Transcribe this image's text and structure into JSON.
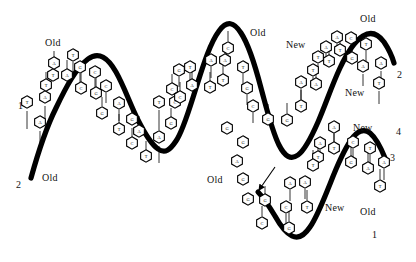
{
  "figure": {
    "background_color": "#ffffff",
    "ink_color": "#000000",
    "width": 416,
    "height": 262
  },
  "strand_labels": [
    {
      "id": "old-top-left",
      "text": "Old",
      "x": 45,
      "y": 38
    },
    {
      "id": "old-bottom-left",
      "text": "Old",
      "x": 42,
      "y": 173
    },
    {
      "id": "old-top-middle",
      "text": "Old",
      "x": 250,
      "y": 28
    },
    {
      "id": "new-top-middle",
      "text": "New",
      "x": 286,
      "y": 40
    },
    {
      "id": "old-top-right",
      "text": "Old",
      "x": 360,
      "y": 14
    },
    {
      "id": "new-right-upper",
      "text": "New",
      "x": 345,
      "y": 88
    },
    {
      "id": "old-center-low",
      "text": "Old",
      "x": 207,
      "y": 175
    },
    {
      "id": "new-lower-right",
      "text": "New",
      "x": 353,
      "y": 123
    },
    {
      "id": "new-lower-mid",
      "text": "New",
      "x": 325,
      "y": 203
    },
    {
      "id": "old-lower-right",
      "text": "Old",
      "x": 360,
      "y": 207
    }
  ],
  "strand_numbers": [
    {
      "id": "num-1-left",
      "text": "1",
      "x": 18,
      "y": 101
    },
    {
      "id": "num-2-left",
      "text": "2",
      "x": 16,
      "y": 180
    },
    {
      "id": "num-2-right",
      "text": "2",
      "x": 397,
      "y": 70
    },
    {
      "id": "num-4-right",
      "text": "4",
      "x": 396,
      "y": 127
    },
    {
      "id": "num-3-right",
      "text": "3",
      "x": 390,
      "y": 153
    },
    {
      "id": "num-1-right",
      "text": "1",
      "x": 372,
      "y": 230
    }
  ],
  "pointer_arrow": {
    "id": "free-nucleotide-arrow",
    "from_x": 275,
    "from_y": 167,
    "to_x": 259,
    "to_y": 190
  },
  "backbones": [
    {
      "id": "parent-strand-upper-left",
      "path": "M 31 178 C 36 160 44 132 56 108 C 66 87 76 68 88 59 C 99 51 108 58 116 72 C 124 86 130 104 138 120 C 145 134 151 144 158 149 C 165 154 170 150 176 141 C 183 131 189 110 196 88 C 203 66 210 43 219 31 C 227 20 234 22 241 33 C 249 45 255 65 261 88 C 267 110 272 131 279 145 C 285 157 291 160 298 155 C 305 150 311 138 318 122 C 325 106 332 85 340 68 C 347 53 355 41 363 36 C 371 31 378 34 384 42 C 388 48 392 56 394 63"
    },
    {
      "id": "daughter-strand-lower-right",
      "path": "M 258 192 C 263 197 269 206 275 216 C 280 225 286 233 292 236 C 298 239 304 236 310 227 C 317 217 323 201 330 184 C 337 166 344 150 351 140 C 357 131 364 128 370 133 C 376 138 381 148 385 158"
    }
  ],
  "base_pairs_legend": {
    "A": "adenine",
    "T": "thymine",
    "G": "guanine",
    "C": "cytosine"
  },
  "bases": [
    {
      "id": "b001",
      "letter": "T",
      "x": 27,
      "y": 102,
      "stem": [
        27,
        111,
        27,
        129
      ]
    },
    {
      "id": "b002",
      "letter": "A",
      "x": 40,
      "y": 122,
      "stem": [
        40,
        131,
        40,
        150
      ]
    },
    {
      "id": "b003",
      "letter": "A",
      "x": 45,
      "y": 97,
      "stem": [
        45,
        106,
        45,
        121
      ]
    },
    {
      "id": "b004",
      "letter": "T",
      "x": 46,
      "y": 85,
      "stem": [
        46,
        80,
        46,
        72
      ]
    },
    {
      "id": "b005",
      "letter": "T",
      "x": 53,
      "y": 75,
      "stem": [
        53,
        70,
        53,
        62
      ]
    },
    {
      "id": "b006",
      "letter": "A",
      "x": 54,
      "y": 63,
      "stem": [
        54,
        58,
        54,
        51
      ]
    },
    {
      "id": "b007",
      "letter": "A",
      "x": 67,
      "y": 75,
      "stem": [
        67,
        69,
        67,
        60
      ]
    },
    {
      "id": "b008",
      "letter": "T",
      "x": 73,
      "y": 55,
      "stem": [
        73,
        62,
        73,
        72
      ]
    },
    {
      "id": "b009",
      "letter": "G",
      "x": 80,
      "y": 67,
      "stem": [
        80,
        74,
        80,
        84
      ]
    },
    {
      "id": "b010",
      "letter": "C",
      "x": 81,
      "y": 88,
      "stem": [
        81,
        82,
        81,
        73
      ]
    },
    {
      "id": "b011",
      "letter": "C",
      "x": 95,
      "y": 72,
      "stem": [
        95,
        79,
        95,
        89
      ]
    },
    {
      "id": "b012",
      "letter": "G",
      "x": 96,
      "y": 93,
      "stem": [
        96,
        87,
        96,
        78
      ]
    },
    {
      "id": "b013",
      "letter": "C",
      "x": 106,
      "y": 86,
      "stem": [
        106,
        93,
        106,
        103
      ]
    },
    {
      "id": "b014",
      "letter": "G",
      "x": 102,
      "y": 113,
      "stem": [
        102,
        106,
        102,
        97
      ]
    },
    {
      "id": "b015",
      "letter": "A",
      "x": 119,
      "y": 103,
      "stem": [
        119,
        110,
        119,
        121
      ]
    },
    {
      "id": "b016",
      "letter": "G",
      "x": 132,
      "y": 119,
      "stem": [
        132,
        113,
        132,
        104
      ]
    },
    {
      "id": "b017",
      "letter": "T",
      "x": 119,
      "y": 129,
      "stem": [
        119,
        123,
        119,
        114
      ]
    },
    {
      "id": "b018",
      "letter": "A",
      "x": 139,
      "y": 131,
      "stem": [
        139,
        125,
        139,
        116
      ]
    },
    {
      "id": "b019",
      "letter": "C",
      "x": 132,
      "y": 143,
      "stem": [
        132,
        137,
        132,
        128
      ]
    },
    {
      "id": "b020",
      "letter": "T",
      "x": 146,
      "y": 156,
      "stem": [
        146,
        150,
        146,
        141
      ]
    },
    {
      "id": "b021",
      "letter": "T",
      "x": 159,
      "y": 102,
      "stem": [
        159,
        110,
        159,
        130
      ]
    },
    {
      "id": "b022",
      "letter": "A",
      "x": 159,
      "y": 137,
      "stem": [
        159,
        146,
        159,
        163
      ]
    },
    {
      "id": "b023",
      "letter": "G",
      "x": 171,
      "y": 123,
      "stem": [
        171,
        117,
        171,
        108
      ]
    },
    {
      "id": "b024",
      "letter": "C",
      "x": 175,
      "y": 102,
      "stem": [
        175,
        96,
        175,
        88
      ]
    },
    {
      "id": "b025",
      "letter": "C",
      "x": 172,
      "y": 89,
      "stem": [
        172,
        83,
        172,
        74
      ]
    },
    {
      "id": "b026",
      "letter": "G",
      "x": 179,
      "y": 70,
      "stem": [
        179,
        77,
        179,
        87
      ]
    },
    {
      "id": "b027",
      "letter": "T",
      "x": 190,
      "y": 67,
      "stem": [
        190,
        74,
        190,
        84
      ]
    },
    {
      "id": "b028",
      "letter": "A",
      "x": 192,
      "y": 85,
      "stem": [
        192,
        79,
        192,
        70
      ]
    },
    {
      "id": "b029",
      "letter": "C",
      "x": 180,
      "y": 97,
      "stem": [
        180,
        91,
        180,
        82
      ]
    },
    {
      "id": "b030",
      "letter": "A",
      "x": 211,
      "y": 60,
      "stem": [
        211,
        67,
        211,
        78
      ]
    },
    {
      "id": "b031",
      "letter": "A",
      "x": 225,
      "y": 60,
      "stem": [
        225,
        54,
        225,
        45
      ]
    },
    {
      "id": "b032",
      "letter": "T",
      "x": 210,
      "y": 87,
      "stem": [
        210,
        81,
        210,
        72
      ]
    },
    {
      "id": "b033",
      "letter": "T",
      "x": 223,
      "y": 80,
      "stem": [
        223,
        74,
        223,
        64
      ]
    },
    {
      "id": "b034",
      "letter": "C",
      "x": 228,
      "y": 48,
      "stem": [
        228,
        41,
        228,
        31
      ]
    },
    {
      "id": "b035",
      "letter": "T",
      "x": 243,
      "y": 67,
      "stem": [
        243,
        74,
        243,
        86
      ]
    },
    {
      "id": "b036",
      "letter": "G",
      "x": 247,
      "y": 88,
      "stem": [
        247,
        95,
        247,
        105
      ]
    },
    {
      "id": "b037",
      "letter": "C",
      "x": 253,
      "y": 106,
      "stem": [
        253,
        113,
        253,
        123
      ]
    },
    {
      "id": "b038",
      "letter": "G",
      "x": 268,
      "y": 119,
      "stem": [
        268,
        113,
        268,
        104
      ]
    },
    {
      "id": "b039",
      "letter": "G",
      "x": 287,
      "y": 120,
      "stem": [
        287,
        113,
        287,
        103
      ]
    },
    {
      "id": "b040",
      "letter": "A",
      "x": 301,
      "y": 82,
      "stem": [
        301,
        89,
        301,
        99
      ]
    },
    {
      "id": "b041",
      "letter": "T",
      "x": 301,
      "y": 106,
      "stem": [
        301,
        100,
        301,
        90
      ]
    },
    {
      "id": "b042",
      "letter": "T",
      "x": 313,
      "y": 70,
      "stem": [
        313,
        77,
        313,
        87
      ]
    },
    {
      "id": "b043",
      "letter": "A",
      "x": 316,
      "y": 84,
      "stem": [
        316,
        78,
        316,
        68
      ]
    },
    {
      "id": "b044",
      "letter": "T",
      "x": 318,
      "y": 57,
      "stem": [
        318,
        64,
        318,
        74
      ]
    },
    {
      "id": "b045",
      "letter": "A",
      "x": 326,
      "y": 47,
      "stem": [
        326,
        54,
        326,
        64
      ]
    },
    {
      "id": "b046",
      "letter": "T",
      "x": 329,
      "y": 61,
      "stem": [
        329,
        55,
        329,
        46
      ]
    },
    {
      "id": "b047",
      "letter": "A",
      "x": 337,
      "y": 37,
      "stem": [
        337,
        44,
        337,
        54
      ]
    },
    {
      "id": "b048",
      "letter": "T",
      "x": 340,
      "y": 50,
      "stem": [
        340,
        44,
        340,
        35
      ]
    },
    {
      "id": "b049",
      "letter": "C",
      "x": 351,
      "y": 38,
      "stem": [
        351,
        45,
        351,
        55
      ]
    },
    {
      "id": "b050",
      "letter": "G",
      "x": 352,
      "y": 58,
      "stem": [
        352,
        52,
        352,
        42
      ]
    },
    {
      "id": "b051",
      "letter": "T",
      "x": 366,
      "y": 44,
      "stem": [
        366,
        51,
        366,
        61
      ]
    },
    {
      "id": "b052",
      "letter": "A",
      "x": 363,
      "y": 66,
      "stem": [
        363,
        74,
        363,
        86
      ]
    },
    {
      "id": "b053",
      "letter": "A",
      "x": 381,
      "y": 63,
      "stem": [
        381,
        71,
        381,
        81
      ]
    },
    {
      "id": "b054",
      "letter": "T",
      "x": 379,
      "y": 83,
      "stem": [
        379,
        91,
        379,
        104
      ]
    },
    {
      "id": "b055",
      "letter": "A",
      "x": 334,
      "y": 127,
      "stem": [
        334,
        134,
        334,
        145
      ]
    },
    {
      "id": "b056",
      "letter": "A",
      "x": 320,
      "y": 143,
      "stem": [
        320,
        150,
        320,
        160
      ]
    },
    {
      "id": "b057",
      "letter": "T",
      "x": 334,
      "y": 148,
      "stem": [
        334,
        142,
        334,
        133
      ]
    },
    {
      "id": "b058",
      "letter": "T",
      "x": 318,
      "y": 157,
      "stem": [
        318,
        151,
        318,
        142
      ]
    },
    {
      "id": "b059",
      "letter": "C",
      "x": 353,
      "y": 142,
      "stem": [
        353,
        149,
        353,
        160
      ]
    },
    {
      "id": "b060",
      "letter": "G",
      "x": 351,
      "y": 162,
      "stem": [
        351,
        156,
        351,
        146
      ]
    },
    {
      "id": "b061",
      "letter": "T",
      "x": 370,
      "y": 148,
      "stem": [
        370,
        155,
        370,
        165
      ]
    },
    {
      "id": "b062",
      "letter": "A",
      "x": 368,
      "y": 168,
      "stem": [
        368,
        162,
        368,
        152
      ]
    },
    {
      "id": "b063",
      "letter": "A",
      "x": 384,
      "y": 162,
      "stem": [
        384,
        169,
        384,
        180
      ]
    },
    {
      "id": "b064",
      "letter": "T",
      "x": 380,
      "y": 186,
      "stem": [
        380,
        179,
        380,
        169
      ]
    },
    {
      "id": "b065",
      "letter": "T",
      "x": 313,
      "y": 165,
      "stem": [
        313,
        159,
        313,
        150
      ]
    },
    {
      "id": "b066",
      "letter": "A",
      "x": 305,
      "y": 182,
      "stem": [
        305,
        189,
        305,
        199
      ]
    },
    {
      "id": "b067",
      "letter": "A",
      "x": 290,
      "y": 183,
      "stem": [
        290,
        190,
        290,
        201
      ]
    },
    {
      "id": "b068",
      "letter": "T",
      "x": 307,
      "y": 207,
      "stem": [
        307,
        200,
        307,
        190
      ]
    },
    {
      "id": "b069",
      "letter": "C",
      "x": 286,
      "y": 207,
      "stem": [
        286,
        214,
        286,
        224
      ]
    },
    {
      "id": "b070",
      "letter": "G",
      "x": 289,
      "y": 228,
      "stem": [
        289,
        221,
        289,
        211
      ]
    },
    {
      "id": "b071",
      "letter": "G",
      "x": 265,
      "y": 200,
      "stem": [
        265,
        194,
        265,
        186
      ]
    },
    {
      "id": "b072",
      "letter": "C",
      "x": 262,
      "y": 223,
      "stem": [
        262,
        216,
        262,
        206
      ]
    },
    {
      "id": "b073",
      "letter": "G",
      "x": 248,
      "y": 199,
      "stem": null
    },
    {
      "id": "b074",
      "letter": "G",
      "x": 243,
      "y": 179,
      "stem": null
    },
    {
      "id": "b075",
      "letter": "A",
      "x": 237,
      "y": 161,
      "stem": null
    },
    {
      "id": "b076",
      "letter": "G",
      "x": 243,
      "y": 142,
      "stem": null
    },
    {
      "id": "b077",
      "letter": "G",
      "x": 227,
      "y": 128,
      "stem": null
    }
  ]
}
